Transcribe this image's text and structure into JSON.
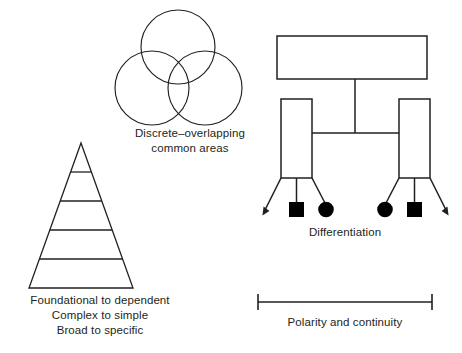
{
  "figure": {
    "background_color": "#ffffff",
    "stroke_color": "#231f20",
    "fill_color": "#000000",
    "width": 462,
    "height": 353
  },
  "venn": {
    "caption": "Discrete–overlapping\ncommon areas",
    "circle_count": 3,
    "circles": [
      {
        "label": "top-circle",
        "cx": 178,
        "cy": 47,
        "r": 37
      },
      {
        "label": "left-circle",
        "cx": 152,
        "cy": 88,
        "r": 37
      },
      {
        "label": "right-circle",
        "cx": 205,
        "cy": 88,
        "r": 37
      }
    ]
  },
  "pyramid": {
    "caption_lines": [
      "Foundational to dependent",
      "Complex to simple",
      "Broad to specific"
    ],
    "caption": "Foundational to dependent\nComplex to simple\nBroad to specific",
    "tier_count": 5,
    "apex": {
      "x": 81,
      "y": 143
    },
    "base_left": {
      "x": 29,
      "y": 288
    },
    "base_right": {
      "x": 133,
      "y": 288
    },
    "divider_y": [
      172,
      201,
      230,
      259
    ]
  },
  "differentiation": {
    "caption": "Differentiation",
    "top_box": {
      "x": 277,
      "y": 36,
      "width": 150,
      "height": 43
    },
    "left_box": {
      "x": 281,
      "y": 99,
      "width": 31,
      "height": 79
    },
    "right_box": {
      "x": 399,
      "y": 99,
      "width": 31,
      "height": 79
    },
    "node_shapes": [
      "square",
      "circle",
      "circle",
      "square"
    ],
    "arrow_count": 2,
    "connector_y": 133,
    "stem_x": 355
  },
  "polarity": {
    "caption": "Polarity and continuity",
    "line_y": 302,
    "left_cap_x": 258,
    "right_cap_x": 432,
    "cap_half_height": 8
  }
}
